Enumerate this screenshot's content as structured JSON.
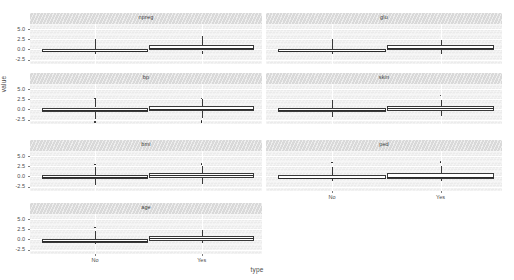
{
  "figure": {
    "ylabel": "value",
    "xlabel": "type",
    "y_ticks": [
      "5.0",
      "2.5",
      "0.0",
      "-2.5"
    ],
    "x_ticks": [
      "No",
      "Yes"
    ],
    "panel_bg": "#ebebeb",
    "strip_bg": "#d9d9d9",
    "grid_color": "#ffffff",
    "box_fill": "#ffffff",
    "box_line": "#3a3a3a"
  },
  "chart_data": {
    "type": "boxplot",
    "title": "",
    "xlabel": "type",
    "ylabel": "value",
    "ylim": [
      -3.6,
      6.2
    ],
    "y_ticks": [
      5.0,
      2.5,
      0.0,
      -2.5
    ],
    "grid": true,
    "legend": "none",
    "facet_layout": {
      "rows": 4,
      "cols": 2,
      "order": "row-major"
    },
    "x_categories": [
      "No",
      "Yes"
    ],
    "facets": [
      {
        "name": "npreg",
        "groups": [
          {
            "type": "No",
            "min": -1.15,
            "q1": -0.55,
            "median": -0.35,
            "q3": 0.15,
            "max": 1.05,
            "whisker_high": 2.55,
            "whisker_low": -1.15,
            "outliers": []
          },
          {
            "type": "Yes",
            "min": -1.1,
            "q1": -0.3,
            "median": 0.35,
            "q3": 0.95,
            "max": 2.0,
            "whisker_high": 3.2,
            "whisker_low": -1.1,
            "outliers": []
          }
        ]
      },
      {
        "name": "glu",
        "groups": [
          {
            "type": "No",
            "min": -1.2,
            "q1": -0.7,
            "median": -0.45,
            "q3": 0.05,
            "max": 0.9,
            "whisker_high": 2.45,
            "whisker_low": -1.2,
            "outliers": []
          },
          {
            "type": "Yes",
            "min": -1.05,
            "q1": -0.25,
            "median": 0.35,
            "q3": 1.0,
            "max": 2.1,
            "whisker_high": 2.3,
            "whisker_low": -1.05,
            "outliers": []
          }
        ]
      },
      {
        "name": "bp",
        "groups": [
          {
            "type": "No",
            "min": -1.15,
            "q1": -0.6,
            "median": -0.15,
            "q3": 0.45,
            "max": 1.25,
            "whisker_high": 2.55,
            "whisker_low": -2.3,
            "outliers": [
              -3.05,
              2.7
            ]
          },
          {
            "type": "Yes",
            "min": -1.05,
            "q1": -0.45,
            "median": 0.2,
            "q3": 0.8,
            "max": 1.55,
            "whisker_high": 2.45,
            "whisker_low": -2.2,
            "outliers": [
              -2.85,
              -3.15,
              2.6
            ]
          }
        ]
      },
      {
        "name": "skin",
        "groups": [
          {
            "type": "No",
            "min": -1.25,
            "q1": -0.7,
            "median": -0.25,
            "q3": 0.35,
            "max": 1.2,
            "whisker_high": 2.4,
            "whisker_low": -1.85,
            "outliers": []
          },
          {
            "type": "Yes",
            "min": -1.1,
            "q1": -0.35,
            "median": 0.25,
            "q3": 0.85,
            "max": 1.7,
            "whisker_high": 2.35,
            "whisker_low": -1.75,
            "outliers": [
              3.35
            ]
          }
        ]
      },
      {
        "name": "bmi",
        "groups": [
          {
            "type": "No",
            "min": -1.3,
            "q1": -0.7,
            "median": -0.25,
            "q3": 0.35,
            "max": 1.15,
            "whisker_high": 2.3,
            "whisker_low": -2.05,
            "outliers": [
              2.85
            ]
          },
          {
            "type": "Yes",
            "min": -1.15,
            "q1": -0.4,
            "median": 0.25,
            "q3": 0.9,
            "max": 1.8,
            "whisker_high": 2.5,
            "whisker_low": -1.95,
            "outliers": [
              3.05
            ]
          }
        ]
      },
      {
        "name": "ped",
        "groups": [
          {
            "type": "No",
            "min": -1.2,
            "q1": -0.75,
            "median": -0.3,
            "q3": 0.3,
            "max": 1.05,
            "whisker_high": 2.25,
            "whisker_low": -1.2,
            "outliers": [
              3.4
            ]
          },
          {
            "type": "Yes",
            "min": -1.15,
            "q1": -0.6,
            "median": -0.05,
            "q3": 0.7,
            "max": 1.6,
            "whisker_high": 2.6,
            "whisker_low": -1.15,
            "outliers": [
              3.45
            ]
          }
        ]
      },
      {
        "name": "age",
        "groups": [
          {
            "type": "No",
            "min": -1.05,
            "q1": -0.8,
            "median": -0.45,
            "q3": 0.1,
            "max": 0.95,
            "whisker_high": 2.15,
            "whisker_low": -1.05,
            "outliers": [
              2.95
            ]
          },
          {
            "type": "Yes",
            "min": -1.0,
            "q1": -0.45,
            "median": 0.25,
            "q3": 0.85,
            "max": 1.95,
            "whisker_high": 2.35,
            "whisker_low": -1.0,
            "outliers": []
          }
        ]
      }
    ]
  }
}
